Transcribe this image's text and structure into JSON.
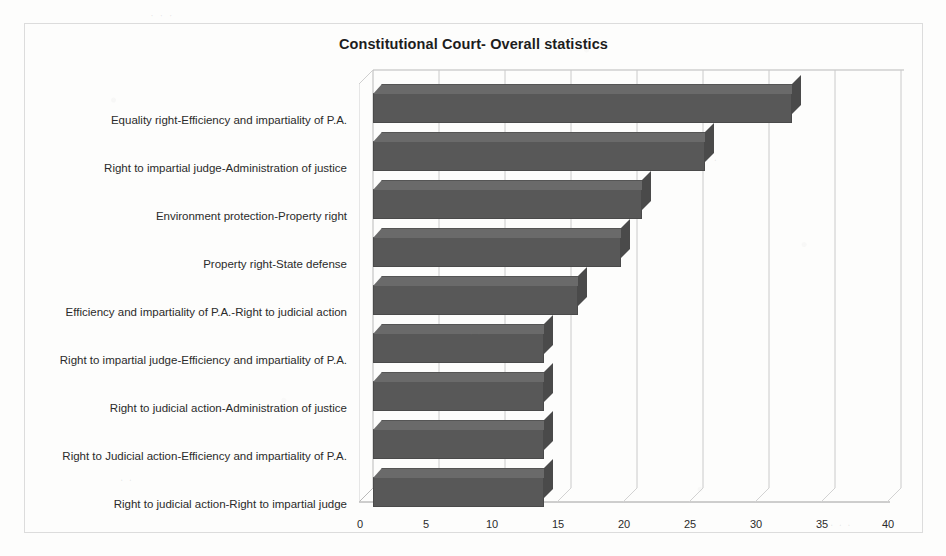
{
  "chart_data": {
    "type": "bar",
    "orientation": "horizontal",
    "title": "Constitutional Court- Overall statistics",
    "xlabel": "",
    "ylabel": "",
    "xlim": [
      0,
      40
    ],
    "xticks": [
      0,
      5,
      10,
      15,
      20,
      25,
      30,
      35,
      40
    ],
    "grid": true,
    "legend": false,
    "bar_color": "#585858",
    "categories": [
      "Equality right-Efficiency and impartiality of P.A.",
      "Right to impartial judge-Administration of justice",
      "Environment protection-Property right",
      "Property right-State defense",
      "Efficiency and impartiality of P.A.-Right to judicial action",
      "Right to impartial judge-Efficiency and impartiality of P.A.",
      "Right to judicial action-Administration of justice",
      "Right to Judicial action-Efficiency and impartiality of P.A.",
      "Right to judicial action-Right to impartial judge"
    ],
    "values": [
      38.5,
      30.5,
      24.7,
      22.8,
      18.8,
      15.7,
      15.7,
      15.7,
      15.7
    ]
  },
  "page": {
    "ghost_marks": [
      {
        "text": "· · ·",
        "x": 150,
        "y": 8
      },
      {
        "text": ". .",
        "x": 705,
        "y": 150
      },
      {
        "text": "' '",
        "x": 470,
        "y": 330
      },
      {
        "text": ". .",
        "x": 120,
        "y": 470
      },
      {
        "text": ". . .",
        "x": 830,
        "y": 515
      }
    ]
  }
}
